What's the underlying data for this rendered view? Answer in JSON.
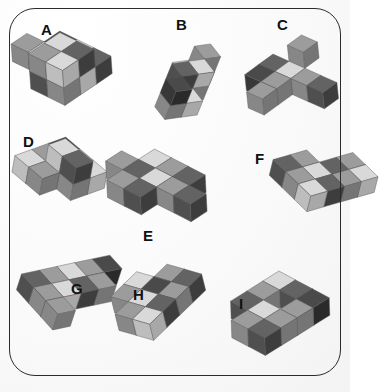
{
  "page": {
    "background_color": "#fbfbfb",
    "frame_color": "#2b2b2b",
    "frame_style": "rounded-rectangle"
  },
  "palette": {
    "light_top": "#d9d9d9",
    "light_left": "#bdbdbd",
    "light_right": "#a8a8a8",
    "mid_top": "#9c9c9c",
    "mid_left": "#878787",
    "mid_right": "#757575",
    "dark_top": "#636363",
    "dark_left": "#4f4f4f",
    "dark_right": "#3d3d3d",
    "vdark_top": "#4a4a4a",
    "vdark_left": "#383838",
    "vdark_right": "#2a2a2a",
    "outline": "#5a5a5a"
  },
  "labels": [
    {
      "id": "A",
      "text": "A",
      "x": 41,
      "y": 22
    },
    {
      "id": "B",
      "text": "B",
      "x": 176,
      "y": 17
    },
    {
      "id": "C",
      "text": "C",
      "x": 277,
      "y": 17
    },
    {
      "id": "D",
      "text": "D",
      "x": 23,
      "y": 134
    },
    {
      "id": "E",
      "text": "E",
      "x": 143,
      "y": 228
    },
    {
      "id": "F",
      "text": "F",
      "x": 255,
      "y": 151
    },
    {
      "id": "G",
      "text": "G",
      "x": 71,
      "y": 281
    },
    {
      "id": "H",
      "text": "H",
      "x": 133,
      "y": 287
    },
    {
      "id": "I",
      "text": "I",
      "x": 239,
      "y": 296
    }
  ],
  "figures": [
    {
      "id": "A",
      "name": "block-assembly-a",
      "label": "A",
      "pos": {
        "x": 10,
        "y": 28
      },
      "rotate": -4,
      "scale": 1.0,
      "cube_size": 19,
      "cubes": [
        {
          "x": 0,
          "y": 1,
          "z": 0,
          "shade": "mid"
        },
        {
          "x": 1,
          "y": 1,
          "z": 0,
          "shade": "light"
        },
        {
          "x": 1,
          "y": 0,
          "z": 0,
          "shade": "vdark"
        },
        {
          "x": 2,
          "y": 0,
          "z": 0,
          "shade": "light"
        },
        {
          "x": 2,
          "y": 1,
          "z": 0,
          "shade": "mid"
        },
        {
          "x": 3,
          "y": 0,
          "z": 0,
          "shade": "dark"
        },
        {
          "x": 3,
          "y": 1,
          "z": 0,
          "shade": "light"
        },
        {
          "x": 2,
          "y": 2,
          "z": 0,
          "shade": "dark"
        },
        {
          "x": 3,
          "y": 2,
          "z": 0,
          "shade": "mid"
        },
        {
          "x": 2,
          "y": 1,
          "z": 1,
          "shade": "light"
        },
        {
          "x": 3,
          "y": 1,
          "z": 1,
          "shade": "dark"
        },
        {
          "x": 2,
          "y": 2,
          "z": 1,
          "shade": "mid"
        },
        {
          "x": 3,
          "y": 2,
          "z": 1,
          "shade": "light"
        }
      ]
    },
    {
      "id": "B",
      "name": "block-assembly-b",
      "label": "B",
      "pos": {
        "x": 160,
        "y": 28
      },
      "rotate": 22,
      "scale": 0.86,
      "cube_size": 19,
      "cubes": [
        {
          "x": 0,
          "y": 0,
          "z": 0,
          "shade": "dark"
        },
        {
          "x": 0,
          "y": 1,
          "z": 0,
          "shade": "light"
        },
        {
          "x": 1,
          "y": 1,
          "z": 0,
          "shade": "mid"
        },
        {
          "x": 1,
          "y": 2,
          "z": 0,
          "shade": "vdark"
        },
        {
          "x": 2,
          "y": 2,
          "z": 0,
          "shade": "light"
        },
        {
          "x": 2,
          "y": 3,
          "z": 0,
          "shade": "mid"
        },
        {
          "x": 0,
          "y": 0,
          "z": 1,
          "shade": "mid"
        },
        {
          "x": 1,
          "y": 1,
          "z": 1,
          "shade": "light"
        },
        {
          "x": 1,
          "y": 2,
          "z": 1,
          "shade": "dark"
        },
        {
          "x": 2,
          "y": 3,
          "z": 1,
          "shade": "vdark"
        }
      ]
    },
    {
      "id": "C",
      "name": "block-assembly-c",
      "label": "C",
      "pos": {
        "x": 238,
        "y": 30
      },
      "rotate": -6,
      "scale": 0.92,
      "cube_size": 19,
      "cubes": [
        {
          "x": 1,
          "y": 0,
          "z": 1,
          "shade": "mid"
        },
        {
          "x": 0,
          "y": 1,
          "z": 0,
          "shade": "dark"
        },
        {
          "x": 1,
          "y": 1,
          "z": 0,
          "shade": "light"
        },
        {
          "x": 2,
          "y": 1,
          "z": 0,
          "shade": "mid"
        },
        {
          "x": 3,
          "y": 1,
          "z": 0,
          "shade": "dark"
        },
        {
          "x": 0,
          "y": 2,
          "z": 0,
          "shade": "vdark"
        },
        {
          "x": 1,
          "y": 2,
          "z": 0,
          "shade": "mid"
        },
        {
          "x": 1,
          "y": 3,
          "z": 0,
          "shade": "mid"
        }
      ]
    },
    {
      "id": "D",
      "name": "block-assembly-d",
      "label": "D",
      "pos": {
        "x": 8,
        "y": 132
      },
      "rotate": 10,
      "scale": 0.95,
      "cube_size": 19,
      "cubes": [
        {
          "x": 0,
          "y": 0,
          "z": 0,
          "shade": "vdark"
        },
        {
          "x": 1,
          "y": 0,
          "z": 0,
          "shade": "mid"
        },
        {
          "x": 2,
          "y": 0,
          "z": 0,
          "shade": "light"
        },
        {
          "x": 0,
          "y": 1,
          "z": 0,
          "shade": "mid"
        },
        {
          "x": 1,
          "y": 1,
          "z": 0,
          "shade": "dark"
        },
        {
          "x": 2,
          "y": 1,
          "z": 0,
          "shade": "mid"
        },
        {
          "x": 0,
          "y": 2,
          "z": 0,
          "shade": "light"
        },
        {
          "x": 1,
          "y": 2,
          "z": 0,
          "shade": "mid"
        },
        {
          "x": 1,
          "y": 1,
          "z": 1,
          "shade": "light"
        },
        {
          "x": 2,
          "y": 1,
          "z": 1,
          "shade": "dark"
        }
      ]
    },
    {
      "id": "E",
      "name": "block-assembly-e",
      "label": "E",
      "pos": {
        "x": 104,
        "y": 146
      },
      "rotate": -3,
      "scale": 1.0,
      "cube_size": 19,
      "cubes": [
        {
          "x": 0,
          "y": 1,
          "z": 0,
          "shade": "mid"
        },
        {
          "x": 1,
          "y": 0,
          "z": 0,
          "shade": "light"
        },
        {
          "x": 1,
          "y": 1,
          "z": 0,
          "shade": "dark"
        },
        {
          "x": 2,
          "y": 0,
          "z": 0,
          "shade": "mid"
        },
        {
          "x": 2,
          "y": 1,
          "z": 0,
          "shade": "light"
        },
        {
          "x": 3,
          "y": 0,
          "z": 0,
          "shade": "dark"
        },
        {
          "x": 3,
          "y": 1,
          "z": 0,
          "shade": "mid"
        },
        {
          "x": 4,
          "y": 1,
          "z": 0,
          "shade": "dark"
        },
        {
          "x": 1,
          "y": 2,
          "z": 0,
          "shade": "mid"
        },
        {
          "x": 2,
          "y": 2,
          "z": 0,
          "shade": "dark"
        }
      ]
    },
    {
      "id": "F",
      "name": "block-assembly-f",
      "label": "F",
      "pos": {
        "x": 262,
        "y": 140
      },
      "rotate": 14,
      "scale": 0.92,
      "cube_size": 19,
      "cubes": [
        {
          "x": 0,
          "y": 0,
          "z": 0,
          "shade": "mid"
        },
        {
          "x": 1,
          "y": 0,
          "z": 0,
          "shade": "light"
        },
        {
          "x": 0,
          "y": 1,
          "z": 0,
          "shade": "dark"
        },
        {
          "x": 1,
          "y": 1,
          "z": 0,
          "shade": "mid"
        },
        {
          "x": 0,
          "y": 2,
          "z": 0,
          "shade": "light"
        },
        {
          "x": 1,
          "y": 2,
          "z": 0,
          "shade": "dark"
        },
        {
          "x": 0,
          "y": 3,
          "z": 0,
          "shade": "mid"
        },
        {
          "x": 1,
          "y": 3,
          "z": 0,
          "shade": "light"
        },
        {
          "x": -1,
          "y": 3,
          "z": 0,
          "shade": "dark"
        },
        {
          "x": -1,
          "y": 2,
          "z": 0,
          "shade": "mid"
        }
      ]
    },
    {
      "id": "G",
      "name": "block-assembly-g",
      "label": "G",
      "pos": {
        "x": 14,
        "y": 238
      },
      "rotate": 18,
      "scale": 0.95,
      "cube_size": 19,
      "cubes": [
        {
          "x": 0,
          "y": 0,
          "z": 0,
          "shade": "vdark"
        },
        {
          "x": 0,
          "y": 1,
          "z": 0,
          "shade": "mid"
        },
        {
          "x": 0,
          "y": 2,
          "z": 0,
          "shade": "light"
        },
        {
          "x": 0,
          "y": 3,
          "z": 0,
          "shade": "mid"
        },
        {
          "x": 0,
          "y": 4,
          "z": 0,
          "shade": "dark"
        },
        {
          "x": 1,
          "y": 2,
          "z": 0,
          "shade": "dark"
        },
        {
          "x": 1,
          "y": 3,
          "z": 0,
          "shade": "light"
        },
        {
          "x": 1,
          "y": 4,
          "z": 0,
          "shade": "mid"
        },
        {
          "x": 2,
          "y": 4,
          "z": 0,
          "shade": "mid"
        },
        {
          "x": 1,
          "y": 1,
          "z": 0,
          "shade": "mid"
        }
      ]
    },
    {
      "id": "H",
      "name": "block-assembly-h",
      "label": "H",
      "pos": {
        "x": 108,
        "y": 262
      },
      "rotate": -14,
      "scale": 0.95,
      "cube_size": 19,
      "cubes": [
        {
          "x": 1,
          "y": 0,
          "z": 0,
          "shade": "mid"
        },
        {
          "x": 1,
          "y": 1,
          "z": 0,
          "shade": "vdark"
        },
        {
          "x": 0,
          "y": 1,
          "z": 0,
          "shade": "light"
        },
        {
          "x": 2,
          "y": 1,
          "z": 0,
          "shade": "mid"
        },
        {
          "x": 0,
          "y": 2,
          "z": 0,
          "shade": "mid"
        },
        {
          "x": 1,
          "y": 2,
          "z": 0,
          "shade": "light"
        },
        {
          "x": 2,
          "y": 2,
          "z": 0,
          "shade": "dark"
        },
        {
          "x": 1,
          "y": 3,
          "z": 0,
          "shade": "mid"
        },
        {
          "x": 2,
          "y": 3,
          "z": 0,
          "shade": "light"
        },
        {
          "x": 2,
          "y": 0,
          "z": 0,
          "shade": "dark"
        }
      ]
    },
    {
      "id": "I",
      "name": "block-assembly-i",
      "label": "I",
      "pos": {
        "x": 228,
        "y": 268
      },
      "rotate": -2,
      "scale": 1.0,
      "cube_size": 19,
      "cubes": [
        {
          "x": 0,
          "y": 0,
          "z": 0,
          "shade": "light"
        },
        {
          "x": 1,
          "y": 0,
          "z": 0,
          "shade": "dark"
        },
        {
          "x": 2,
          "y": 0,
          "z": 0,
          "shade": "vdark"
        },
        {
          "x": 0,
          "y": 1,
          "z": 0,
          "shade": "mid"
        },
        {
          "x": 2,
          "y": 1,
          "z": 0,
          "shade": "mid"
        },
        {
          "x": 0,
          "y": 2,
          "z": 0,
          "shade": "dark"
        },
        {
          "x": 1,
          "y": 2,
          "z": 0,
          "shade": "light"
        },
        {
          "x": 2,
          "y": 2,
          "z": 0,
          "shade": "mid"
        },
        {
          "x": 1,
          "y": 3,
          "z": 0,
          "shade": "mid"
        },
        {
          "x": 2,
          "y": 3,
          "z": 0,
          "shade": "dark"
        }
      ]
    }
  ]
}
